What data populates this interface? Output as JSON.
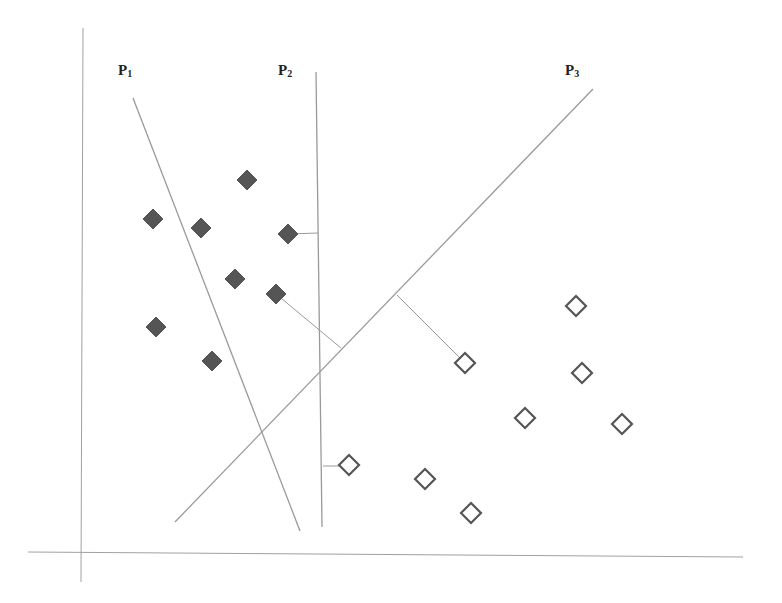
{
  "diagram": {
    "labels": [
      {
        "id": "p1",
        "text": "P",
        "sub": "1",
        "x": 118,
        "y": 62
      },
      {
        "id": "p2",
        "text": "P",
        "sub": "2",
        "x": 278,
        "y": 62
      },
      {
        "id": "p3",
        "text": "P",
        "sub": "3",
        "x": 565,
        "y": 62
      }
    ],
    "axes": {
      "vertical": {
        "x1": 83,
        "y1": 28,
        "x2": 81,
        "y2": 582
      },
      "horizontal": {
        "x1": 28,
        "y1": 552,
        "x2": 743,
        "y2": 557
      }
    },
    "hyperplanes": [
      {
        "name": "P1",
        "x1": 133,
        "y1": 98,
        "x2": 300,
        "y2": 531
      },
      {
        "name": "P2",
        "x1": 316,
        "y1": 72,
        "x2": 322,
        "y2": 527
      },
      {
        "name": "P3",
        "x1": 593,
        "y1": 89,
        "x2": 175,
        "y2": 522
      }
    ],
    "margin_lines": [
      {
        "x1": 288,
        "y1": 234,
        "x2": 318,
        "y2": 233
      },
      {
        "x1": 276,
        "y1": 294,
        "x2": 341,
        "y2": 348
      },
      {
        "x1": 397,
        "y1": 295,
        "x2": 465,
        "y2": 363
      },
      {
        "x1": 323,
        "y1": 466,
        "x2": 349,
        "y2": 466
      }
    ],
    "class_filled": {
      "color": "#555555",
      "points": [
        [
          247,
          180
        ],
        [
          153,
          219
        ],
        [
          201,
          228
        ],
        [
          288,
          234
        ],
        [
          235,
          279
        ],
        [
          276,
          294
        ],
        [
          156,
          327
        ],
        [
          212,
          361
        ]
      ]
    },
    "class_open": {
      "color": "#555555",
      "points": [
        [
          576,
          306
        ],
        [
          465,
          363
        ],
        [
          582,
          373
        ],
        [
          525,
          418
        ],
        [
          622,
          424
        ],
        [
          349,
          465
        ],
        [
          425,
          479
        ],
        [
          471,
          513
        ]
      ]
    },
    "line_color": "#9a9a9a",
    "axis_color": "#a0a0a0"
  }
}
